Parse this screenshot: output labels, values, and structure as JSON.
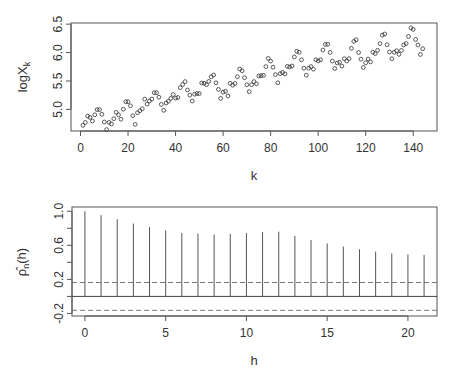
{
  "chart_data": [
    {
      "type": "scatter",
      "title": "",
      "xlabel": "k",
      "ylabel": "logX_k",
      "xlim": [
        -4,
        150
      ],
      "ylim": [
        4.62,
        6.52
      ],
      "xticks": [
        0,
        20,
        40,
        60,
        80,
        100,
        120,
        140
      ],
      "yticks": [
        5.0,
        5.5,
        6.0,
        6.5
      ],
      "grid": false,
      "marker": "open-circle",
      "x_start": 1,
      "values": [
        4.718,
        4.771,
        4.883,
        4.86,
        4.796,
        4.905,
        4.997,
        4.997,
        4.913,
        4.779,
        4.644,
        4.771,
        4.745,
        4.836,
        4.949,
        4.905,
        4.828,
        5.004,
        5.136,
        5.136,
        5.063,
        4.89,
        4.736,
        4.942,
        4.977,
        5.011,
        5.182,
        5.094,
        5.147,
        5.182,
        5.293,
        5.293,
        5.215,
        5.088,
        4.984,
        5.112,
        5.142,
        5.193,
        5.263,
        5.198,
        5.209,
        5.384,
        5.438,
        5.489,
        5.342,
        5.252,
        5.147,
        5.268,
        5.279,
        5.278,
        5.464,
        5.46,
        5.434,
        5.493,
        5.576,
        5.606,
        5.468,
        5.352,
        5.193,
        5.303,
        5.318,
        5.236,
        5.46,
        5.425,
        5.455,
        5.576,
        5.71,
        5.68,
        5.557,
        5.434,
        5.313,
        5.434,
        5.489,
        5.451,
        5.587,
        5.595,
        5.598,
        5.753,
        5.897,
        5.849,
        5.743,
        5.613,
        5.468,
        5.628,
        5.649,
        5.624,
        5.759,
        5.746,
        5.763,
        5.924,
        6.023,
        6.004,
        5.872,
        5.724,
        5.602,
        5.724,
        5.753,
        5.707,
        5.875,
        5.852,
        5.872,
        6.045,
        6.142,
        6.146,
        6.001,
        5.849,
        5.72,
        5.817,
        5.829,
        5.762,
        5.892,
        5.852,
        5.894,
        6.075,
        6.196,
        6.225,
        6.001,
        5.883,
        5.737,
        5.82,
        5.886,
        5.835,
        6.006,
        5.981,
        6.04,
        6.157,
        6.306,
        6.326,
        6.138,
        6.009,
        5.892,
        6.004,
        6.033,
        5.969,
        6.038,
        6.133,
        6.157,
        6.282,
        6.433,
        6.407,
        6.23,
        6.133,
        5.966,
        6.068
      ]
    },
    {
      "type": "bar",
      "subtype": "acf-lollipop",
      "title": "",
      "xlabel": "h",
      "ylabel": "ρ̂_n(h)",
      "xlim": [
        -0.8,
        21.8
      ],
      "ylim": [
        -0.23,
        1.05
      ],
      "xticks": [
        0,
        5,
        10,
        15,
        20
      ],
      "yticks": [
        -0.2,
        0.2,
        0.6,
        1.0
      ],
      "yticks_minor": [
        0.0,
        0.4,
        0.8
      ],
      "grid": false,
      "confidence_bounds": [
        0.163,
        -0.163
      ],
      "categories": [
        0,
        1,
        2,
        3,
        4,
        5,
        6,
        7,
        8,
        9,
        10,
        11,
        12,
        13,
        14,
        15,
        16,
        17,
        18,
        19,
        20,
        21
      ],
      "values": [
        1.0,
        0.954,
        0.907,
        0.856,
        0.813,
        0.776,
        0.745,
        0.737,
        0.727,
        0.734,
        0.744,
        0.755,
        0.76,
        0.712,
        0.662,
        0.622,
        0.586,
        0.554,
        0.526,
        0.504,
        0.493,
        0.487
      ]
    }
  ],
  "labels": {
    "top_ylabel_main": "logX",
    "top_ylabel_sub": "k",
    "top_xlabel": "k",
    "bottom_ylabel_main": "ρ̂",
    "bottom_ylabel_sub": "n",
    "bottom_ylabel_arg": "(h)",
    "bottom_xlabel": "h"
  }
}
